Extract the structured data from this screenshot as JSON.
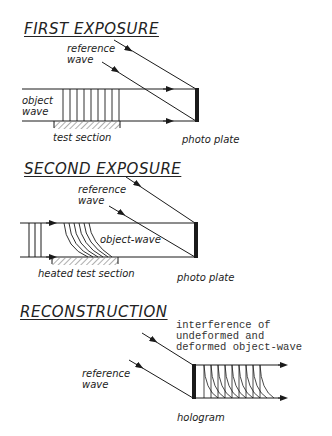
{
  "panels": {
    "first": {
      "title": "FIRST EXPOSURE",
      "reference_wave": "reference\nwave",
      "object_wave": "object\nwave",
      "test_section": "test section",
      "photo_plate": "photo plate"
    },
    "second": {
      "title": "SECOND EXPOSURE",
      "reference_wave": "reference\nwave",
      "object_wave": "object-wave",
      "test_section": "heated test section",
      "photo_plate": "photo plate"
    },
    "reconstruction": {
      "title": "RECONSTRUCTION",
      "interference": "interference of\nundeformed and\ndeformed object-wave",
      "reference_wave": "reference\nwave",
      "hologram": "hologram"
    }
  },
  "colors": {
    "line": "#1a1a1a",
    "background": "#ffffff"
  }
}
